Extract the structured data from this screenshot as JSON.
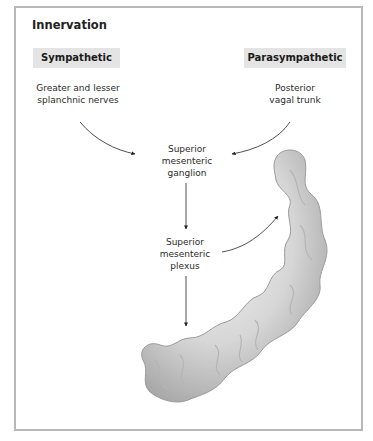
{
  "title": "Innervation",
  "headers": {
    "sympathetic": "Sympathetic",
    "parasympathetic": "Parasympathetic"
  },
  "nodes": {
    "sympathetic_source": [
      "Greater and lesser",
      "splanchnic nerves"
    ],
    "parasympathetic_source": [
      "Posterior",
      "vagal trunk"
    ],
    "ganglion": [
      "Superior",
      "mesenteric",
      "ganglion"
    ],
    "plexus": [
      "Superior",
      "mesenteric",
      "plexus"
    ]
  },
  "illustration": "small-intestine (jejunum and ileum)",
  "colors": {
    "frame": "#b8b8b8",
    "header_bg": "#e4e4e4",
    "text": "#1a1a1a",
    "arrow": "#222222"
  }
}
